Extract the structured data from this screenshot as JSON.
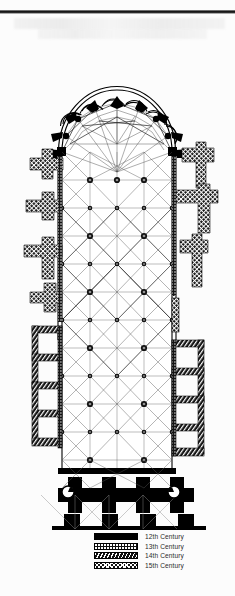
{
  "document": {
    "kind": "architectural-floor-plan",
    "subject": "Gothic cathedral ground plan",
    "orientation": "apse at top (east), west front at bottom"
  },
  "legend": {
    "title": "",
    "items": [
      {
        "label": "12th Century",
        "pattern": "solid-black",
        "color": "#000000"
      },
      {
        "label": "13th Century",
        "pattern": "stipple-dots",
        "color": "#111111"
      },
      {
        "label": "14th Century",
        "pattern": "diagonal-hatch",
        "color": "#111111"
      },
      {
        "label": "15th Century",
        "pattern": "cross-hatch",
        "color": "#141414"
      }
    ]
  },
  "plan": {
    "ink": "#000000",
    "rib_line": "#3a3a3a",
    "paper": "#fcfcfc",
    "parts": [
      {
        "name": "chevet-apse",
        "period": "12th Century"
      },
      {
        "name": "radiating-chapels",
        "period": "13th Century",
        "count": 7
      },
      {
        "name": "ambulatory",
        "period": "13th Century"
      },
      {
        "name": "choir",
        "period": "13th Century"
      },
      {
        "name": "nave",
        "period": "13th Century",
        "bays": 6
      },
      {
        "name": "north-side-chapels",
        "period": "14th Century"
      },
      {
        "name": "south-side-chapels",
        "period": "15th Century"
      },
      {
        "name": "west-front-towers",
        "period": "12th Century"
      },
      {
        "name": "stair-turrets",
        "period": "12th Century",
        "count": 2
      }
    ]
  }
}
